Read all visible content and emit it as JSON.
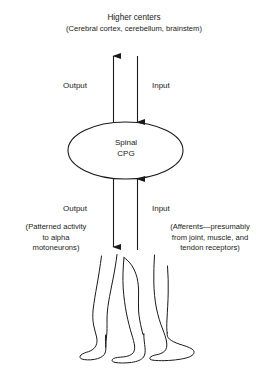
{
  "figure": {
    "background_color": "#ffffff",
    "stroke_color": "#1a1a1a",
    "width": 268,
    "height": 376
  },
  "nodes": {
    "higher_centers": {
      "title": "Higher centers",
      "detail": "(Cerebral cortex, cerebellum, brainstem)"
    },
    "spinal_cpg": {
      "line1": "Spinal",
      "line2": "CPG"
    },
    "legs": {
      "caption": "walking-legs-line-drawing"
    }
  },
  "pathways": {
    "upper_output": {
      "label": "Output",
      "direction": "up",
      "from": "Spinal CPG",
      "to": "Higher centers"
    },
    "upper_input": {
      "label": "Input",
      "direction": "down",
      "from": "Higher centers",
      "to": "Spinal CPG"
    },
    "lower_output": {
      "label": "Output",
      "direction": "down",
      "from": "Spinal CPG",
      "to": "Legs",
      "detail": "(Patterned activity to alpha motoneurons)",
      "detail_lines": [
        "(Patterned activity",
        "to alpha",
        "motoneurons)"
      ]
    },
    "lower_input": {
      "label": "Input",
      "direction": "up",
      "from": "Legs",
      "to": "Spinal CPG",
      "detail": "(Afferents—presumably from joint, muscle, and tendon receptors)",
      "detail_lines": [
        "(Afferents—presumably",
        "from joint, muscle, and",
        "tendon receptors)"
      ]
    }
  },
  "icons": {
    "arrow_up": "arrow-up-icon",
    "arrow_down": "arrow-down-icon",
    "ellipse": "ellipse-node-icon",
    "legs": "legs-icon"
  }
}
